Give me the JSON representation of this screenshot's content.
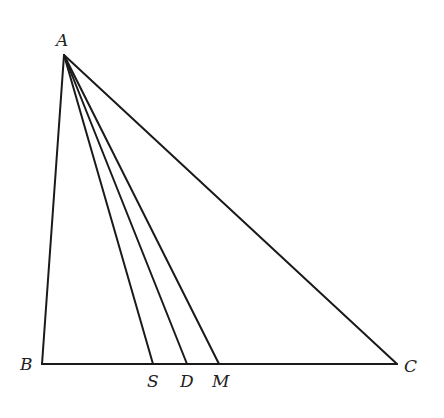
{
  "diagram": {
    "type": "triangle-cevians",
    "stroke_color": "#1a1a1a",
    "points": {
      "A": {
        "label": "A",
        "x": 64,
        "y": 55
      },
      "B": {
        "label": "B",
        "x": 42,
        "y": 364
      },
      "C": {
        "label": "C",
        "x": 397,
        "y": 364
      },
      "S": {
        "label": "S",
        "x": 153,
        "y": 364
      },
      "D": {
        "label": "D",
        "x": 187,
        "y": 364
      },
      "M": {
        "label": "M",
        "x": 219,
        "y": 364
      }
    },
    "segments": [
      "AB",
      "AC",
      "BC",
      "AS",
      "AD",
      "AM"
    ]
  }
}
